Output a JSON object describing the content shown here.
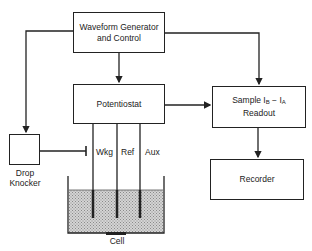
{
  "diagram": {
    "blocks": {
      "waveform": {
        "line1": "Waveform Generator",
        "line2": "and Control"
      },
      "potentiostat": {
        "label": "Potentiostat"
      },
      "sample": {
        "prefix": "Sample I",
        "sub_b": "B",
        "minus": " − I",
        "sub_a": "A",
        "line2": "Readout"
      },
      "recorder": {
        "label": "Recorder"
      },
      "drop_knocker": {
        "line1": "Drop",
        "line2": "Knocker"
      }
    },
    "electrodes": {
      "wkg": "Wkg",
      "ref": "Ref",
      "aux": "Aux"
    },
    "cell": {
      "label": "Cell"
    },
    "colors": {
      "line": "#222222",
      "solution": "#c8c8c8"
    }
  }
}
